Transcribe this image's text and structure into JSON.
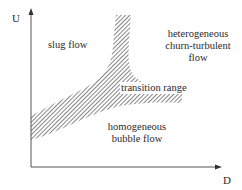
{
  "diagram": {
    "type": "flow-regime-map",
    "axes": {
      "x_label": "D",
      "y_label": "U"
    },
    "regions": {
      "slug": "slug flow",
      "heterogeneous_line1": "heterogeneous",
      "heterogeneous_line2": "churn-turbulent",
      "heterogeneous_line3": "flow",
      "transition": "transition range",
      "homogeneous_line1": "homogeneous",
      "homogeneous_line2": "bubble flow"
    },
    "colors": {
      "axis": "#555555",
      "hatch": "#444444",
      "text": "#2a2a2a"
    }
  }
}
